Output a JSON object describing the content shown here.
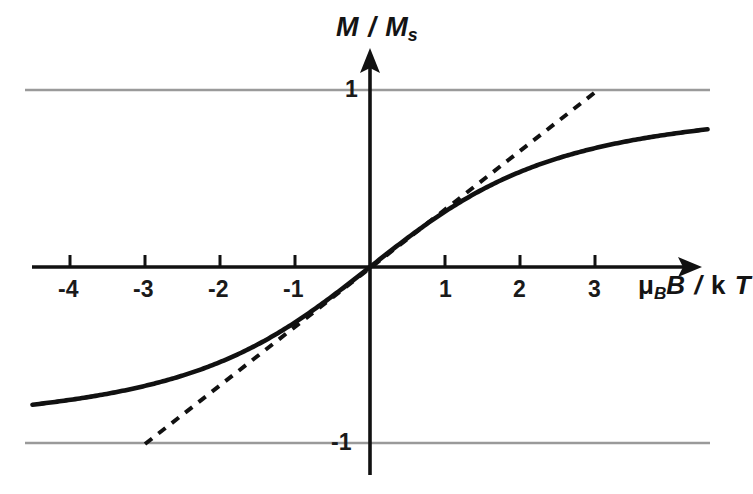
{
  "chart_data": {
    "type": "line",
    "title": "",
    "xlabel": "μ_B B / k T",
    "ylabel": "M / M_s",
    "xlim": [
      -4.6,
      4.5
    ],
    "ylim": [
      -1.25,
      1.25
    ],
    "grid": "horizontal gridlines at y = 1 and y = -1 only",
    "legend": "none",
    "x_ticks": [
      -4,
      -3,
      -2,
      -1,
      1,
      2,
      3
    ],
    "x_tick_labels": [
      "-4",
      "-3",
      "-2",
      "-1",
      "1",
      "2",
      "3"
    ],
    "y_ticks": [
      1,
      -1
    ],
    "y_tick_labels": [
      "1",
      "-1"
    ],
    "axis_style": "arrow-terminated axes crossing at origin",
    "series": [
      {
        "name": "Langevin function L(x) = coth(x) - 1/x",
        "style": "solid",
        "color": "#111111",
        "x": [
          -4.5,
          -4.25,
          -4.0,
          -3.75,
          -3.5,
          -3.25,
          -3.0,
          -2.75,
          -2.5,
          -2.25,
          -2.0,
          -1.75,
          -1.5,
          -1.25,
          -1.0,
          -0.75,
          -0.5,
          -0.25,
          0.0,
          0.25,
          0.5,
          0.75,
          1.0,
          1.25,
          1.5,
          1.75,
          2.0,
          2.25,
          2.5,
          2.75,
          3.0,
          3.25,
          3.5,
          3.75,
          4.0,
          4.25,
          4.5
        ],
        "y": [
          -0.7776,
          -0.7648,
          -0.7507,
          -0.7352,
          -0.7179,
          -0.6987,
          -0.6773,
          -0.6533,
          -0.6264,
          -0.5962,
          -0.5621,
          -0.5236,
          -0.4801,
          -0.4308,
          -0.313,
          -0.2867,
          -0.164,
          -0.0831,
          0.0,
          0.0831,
          0.164,
          0.2405,
          0.313,
          0.4308,
          0.4801,
          0.5236,
          0.5621,
          0.5962,
          0.6264,
          0.6533,
          0.6773,
          0.6987,
          0.7179,
          0.7352,
          0.7507,
          0.7648,
          0.7776
        ]
      },
      {
        "name": "Initial slope tangent (slope = 1/3)",
        "style": "dashed",
        "color": "#111111",
        "x": [
          -3.0,
          3.04
        ],
        "y": [
          -1.0,
          1.0
        ]
      }
    ]
  },
  "axes": {
    "y_axis_label": {
      "numerator": "M",
      "slash": "/",
      "denominator": "M",
      "denominator_sub": "s"
    },
    "x_axis_label": {
      "mu": "μ",
      "mu_sub": "B",
      "field": "B",
      "slash": "/",
      "boltzmann": "k",
      "temperature": "T"
    }
  },
  "labels": {
    "x_ticks": [
      {
        "text": "-4",
        "value": -4
      },
      {
        "text": "-3",
        "value": -3
      },
      {
        "text": "-2",
        "value": -2
      },
      {
        "text": "-1",
        "value": -1
      },
      {
        "text": "1",
        "value": 1
      },
      {
        "text": "2",
        "value": 2
      },
      {
        "text": "3",
        "value": 3
      }
    ],
    "y_ticks": [
      {
        "text": "1",
        "value": 1
      },
      {
        "text": "-1",
        "value": -1
      }
    ]
  },
  "colors": {
    "background": "#ffffff",
    "axis": "#111111",
    "curve": "#111111",
    "tangent": "#111111",
    "gridline": "#9a9a9a",
    "text": "#1a1a1a"
  }
}
